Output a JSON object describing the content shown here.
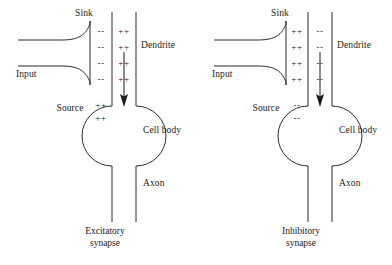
{
  "figure": {
    "panels": [
      {
        "id": "excitatory",
        "caption_line1": "Excitatory",
        "caption_line2": "synapse",
        "labels": {
          "sink": "Sink",
          "source": "Source",
          "input": "Input",
          "dendrite": "Dendrite",
          "cell_body": "Cell body",
          "axon": "Axon"
        },
        "charges": {
          "cleft_outer": [
            "--",
            "--",
            "--",
            "--"
          ],
          "cleft_inner": [
            "++",
            "++",
            "++",
            "++"
          ],
          "source_rows": [
            "++",
            "++"
          ]
        },
        "current_arrow_direction": "down"
      },
      {
        "id": "inhibitory",
        "caption_line1": "Inhibitory",
        "caption_line2": "synapse",
        "labels": {
          "sink": "Sink",
          "source": "Source",
          "input": "Input",
          "dendrite": "Dendrite",
          "cell_body": "Cell body",
          "axon": "Axon"
        },
        "charges": {
          "cleft_outer": [
            "++",
            "++",
            "++",
            "++"
          ],
          "cleft_inner": [
            "--",
            "--",
            "--",
            "--"
          ],
          "source_rows": [
            "--",
            "--"
          ]
        },
        "current_arrow_direction": "down"
      }
    ],
    "colors": {
      "stroke": "#2b2b2b",
      "text": "#1a1a1a",
      "background": "#ffffff"
    }
  }
}
